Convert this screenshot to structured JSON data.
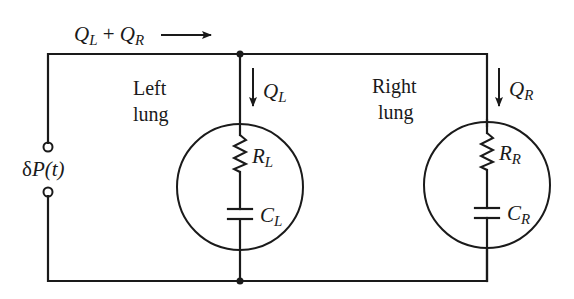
{
  "diagram": {
    "type": "electrical-circuit-analogy",
    "top_flow_label": {
      "main": "Q",
      "sub_a": "L",
      "plus": " + ",
      "main2": "Q",
      "sub_b": "R"
    },
    "source": {
      "label_prefix": "δ",
      "label_var": "P",
      "label_arg": "(t)"
    },
    "left_lung": {
      "title_line1": "Left",
      "title_line2": "lung",
      "flow": {
        "main": "Q",
        "sub": "L"
      },
      "resistor": {
        "main": "R",
        "sub": "L"
      },
      "capacitor": {
        "main": "C",
        "sub": "L"
      }
    },
    "right_lung": {
      "title_line1": "Right",
      "title_line2": "lung",
      "flow": {
        "main": "Q",
        "sub": "R"
      },
      "resistor": {
        "main": "R",
        "sub": "R"
      },
      "capacitor": {
        "main": "C",
        "sub": "R"
      }
    },
    "colors": {
      "ink": "#1a1a1a",
      "background": "#ffffff"
    }
  }
}
